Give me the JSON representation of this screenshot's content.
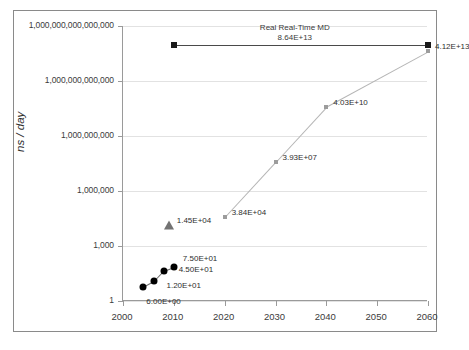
{
  "chart_data": {
    "type": "scatter",
    "title": "",
    "xlabel": "",
    "ylabel": "ns / day",
    "xlim": [
      2000,
      2060
    ],
    "ylim": [
      1,
      1000000000000000
    ],
    "yscale": "log",
    "grid": true,
    "legend": "none",
    "x_ticks": [
      "2000",
      "2010",
      "2020",
      "2030",
      "2040",
      "2050",
      "2060"
    ],
    "x_tick_values": [
      2000,
      2010,
      2020,
      2030,
      2040,
      2050,
      2060
    ],
    "y_ticks": [
      "1,000,000,000,000,000",
      "1,000,000,000,000",
      "1,000,000,000",
      "1,000,000",
      "1,000",
      "1"
    ],
    "y_tick_values": [
      1000000000000000,
      1000000000000,
      1000000000,
      1000000,
      1000,
      1
    ],
    "annotations": [
      {
        "text": "Real Real-Time MD",
        "value_text": "8.64E+13",
        "value": 86400000000000
      }
    ],
    "series": [
      {
        "name": "historical-md",
        "marker": "circle",
        "color": "#000000",
        "points": [
          {
            "x": 2004,
            "y": 6,
            "label": "6.00E+00"
          },
          {
            "x": 2006,
            "y": 12,
            "label": "1.20E+01"
          },
          {
            "x": 2008,
            "y": 45,
            "label": "4.50E+01"
          },
          {
            "x": 2010,
            "y": 75,
            "label": "7.50E+01"
          }
        ]
      },
      {
        "name": "anton-special-purpose",
        "marker": "triangle",
        "color": "#737373",
        "points": [
          {
            "x": 2009,
            "y": 14500,
            "label": "1.45E+04"
          }
        ]
      },
      {
        "name": "projection",
        "marker": "square",
        "color": "#9c9c9c",
        "points": [
          {
            "x": 2020,
            "y": 38400,
            "label": "3.84E+04"
          },
          {
            "x": 2030,
            "y": 39300000,
            "label": "3.93E+07"
          },
          {
            "x": 2040,
            "y": 40300000000,
            "label": "4.03E+10"
          },
          {
            "x": 2060,
            "y": 41200000000000,
            "label": "4.12E+13"
          }
        ]
      }
    ]
  }
}
